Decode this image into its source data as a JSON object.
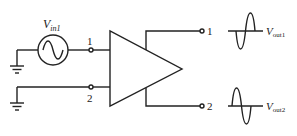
{
  "diagram": {
    "type": "differential amplifier input/output schematic",
    "source": {
      "label_main": "V",
      "label_sub": "in1",
      "symbol": "ac-sine-source"
    },
    "inputs": [
      {
        "terminal": "1"
      },
      {
        "terminal": "2"
      }
    ],
    "outputs": [
      {
        "terminal": "1",
        "label_main": "V",
        "label_sub": "out1",
        "waveform_phase": "inverted"
      },
      {
        "terminal": "2",
        "label_main": "V",
        "label_sub": "out2",
        "waveform_phase": "non-inverted"
      }
    ],
    "colors": {
      "stroke": "#222222",
      "background": "#ffffff"
    }
  }
}
